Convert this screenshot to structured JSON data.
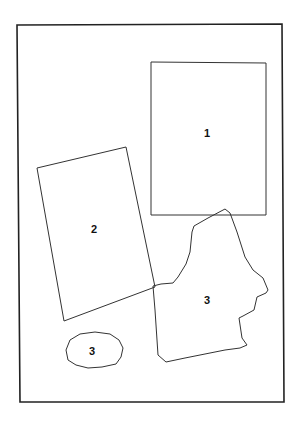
{
  "diagram": {
    "background": "#ffffff",
    "stroke_color": "#222222",
    "frame": {
      "points": "17,25 282,24 284,402 20,402"
    },
    "shapes": [
      {
        "id": "rect-1",
        "label": "1",
        "kind": "rectangle",
        "points": "151,62 266,63 266,215 151,215",
        "label_pos": [
          207,
          137
        ]
      },
      {
        "id": "rect-2",
        "label": "2",
        "kind": "tilted-rectangle",
        "points": "37,168 126,147 155,287 64,321",
        "label_pos": [
          94,
          233
        ]
      },
      {
        "id": "irregular-3",
        "label": "3",
        "kind": "irregular-polygon",
        "points": "153,286 161,284 173,283 178,277 186,264 190,252 192,232 194,226 208,218 225,209 230,213 237,232 245,257 253,270 263,278 268,290 266,293 257,297 254,310 243,316 239,318 242,338 247,345 240,348 225,350 210,353 185,358 166,362 158,355 157,340 155,310",
        "label_pos": [
          207,
          304
        ]
      },
      {
        "id": "oval-3",
        "label": "3",
        "kind": "oval",
        "points": "66,350 70,340 80,334 95,332 110,334 119,340 123,348 121,357 116,364 102,367 88,368 76,365 68,360",
        "label_pos": [
          92,
          355
        ]
      }
    ]
  }
}
